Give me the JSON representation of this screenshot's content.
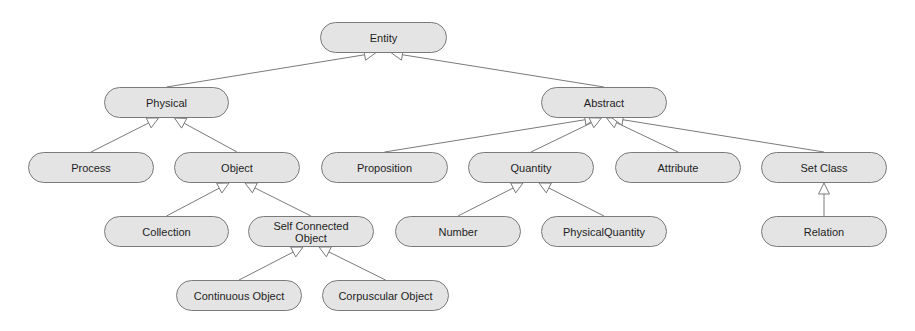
{
  "diagram": {
    "type": "class-hierarchy",
    "colors": {
      "node_fill": "#e4e4e4",
      "node_border": "#7a7a7a",
      "edge": "#7a7a7a",
      "text": "#1e1e1e",
      "background": "#ffffff"
    },
    "nodes": [
      {
        "id": "entity",
        "label": "Entity",
        "x": 320,
        "y": 22,
        "w": 127,
        "h": 31
      },
      {
        "id": "physical",
        "label": "Physical",
        "x": 104,
        "y": 87,
        "w": 125,
        "h": 31
      },
      {
        "id": "abstract",
        "label": "Abstract",
        "x": 541,
        "y": 87,
        "w": 126,
        "h": 31
      },
      {
        "id": "process",
        "label": "Process",
        "x": 28,
        "y": 152,
        "w": 126,
        "h": 31
      },
      {
        "id": "object",
        "label": "Object",
        "x": 174,
        "y": 152,
        "w": 126,
        "h": 31
      },
      {
        "id": "proposition",
        "label": "Proposition",
        "x": 321,
        "y": 152,
        "w": 127,
        "h": 31
      },
      {
        "id": "quantity",
        "label": "Quantity",
        "x": 468,
        "y": 152,
        "w": 126,
        "h": 31
      },
      {
        "id": "attribute",
        "label": "Attribute",
        "x": 615,
        "y": 152,
        "w": 126,
        "h": 31
      },
      {
        "id": "setclass",
        "label": "Set Class",
        "x": 761,
        "y": 152,
        "w": 126,
        "h": 31
      },
      {
        "id": "collection",
        "label": "Collection",
        "x": 104,
        "y": 216,
        "w": 125,
        "h": 31
      },
      {
        "id": "selfconnected",
        "label": "Self Connected Object",
        "x": 248,
        "y": 216,
        "w": 126,
        "h": 31
      },
      {
        "id": "number",
        "label": "Number",
        "x": 395,
        "y": 216,
        "w": 126,
        "h": 31
      },
      {
        "id": "physicalquantity",
        "label": "PhysicalQuantity",
        "x": 541,
        "y": 216,
        "w": 126,
        "h": 31
      },
      {
        "id": "relation",
        "label": "Relation",
        "x": 761,
        "y": 216,
        "w": 126,
        "h": 31
      },
      {
        "id": "continuous",
        "label": "Continuous Object",
        "x": 176,
        "y": 280,
        "w": 126,
        "h": 31
      },
      {
        "id": "corpuscular",
        "label": "Corpuscular Object",
        "x": 322,
        "y": 280,
        "w": 127,
        "h": 31
      }
    ],
    "edges": [
      {
        "from": "physical",
        "to": "entity",
        "arrow": "hollow-triangle"
      },
      {
        "from": "abstract",
        "to": "entity",
        "arrow": "hollow-triangle"
      },
      {
        "from": "process",
        "to": "physical",
        "arrow": "hollow-triangle"
      },
      {
        "from": "object",
        "to": "physical",
        "arrow": "hollow-triangle"
      },
      {
        "from": "proposition",
        "to": "abstract",
        "arrow": "hollow-triangle"
      },
      {
        "from": "quantity",
        "to": "abstract",
        "arrow": "hollow-triangle"
      },
      {
        "from": "attribute",
        "to": "abstract",
        "arrow": "hollow-triangle"
      },
      {
        "from": "setclass",
        "to": "abstract",
        "arrow": "hollow-triangle"
      },
      {
        "from": "collection",
        "to": "object",
        "arrow": "hollow-triangle"
      },
      {
        "from": "selfconnected",
        "to": "object",
        "arrow": "hollow-triangle"
      },
      {
        "from": "number",
        "to": "quantity",
        "arrow": "hollow-triangle"
      },
      {
        "from": "physicalquantity",
        "to": "quantity",
        "arrow": "hollow-triangle"
      },
      {
        "from": "relation",
        "to": "setclass",
        "arrow": "hollow-triangle"
      },
      {
        "from": "continuous",
        "to": "selfconnected",
        "arrow": "hollow-triangle"
      },
      {
        "from": "corpuscular",
        "to": "selfconnected",
        "arrow": "hollow-triangle"
      }
    ]
  }
}
